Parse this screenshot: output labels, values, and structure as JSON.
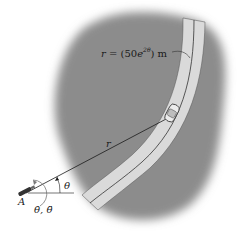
{
  "figure": {
    "equation": {
      "prefix": "r = (50",
      "base": "e",
      "exponent": "2θ",
      "suffix": ") m"
    },
    "labels": {
      "radius": "r",
      "angle": "θ",
      "point": "A",
      "rates": "θ̇, θ̈"
    },
    "colors": {
      "terrain": "#8a8a8a",
      "road": "#d9d9d9",
      "lines": "#1a1a1a",
      "background": "#ffffff"
    }
  }
}
